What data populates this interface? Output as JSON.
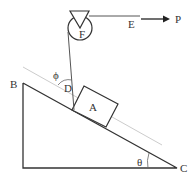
{
  "diagram": {
    "type": "physics-incline-pulley",
    "labels": {
      "pulley": "F",
      "rope_end": "E",
      "force": "P",
      "block": "A",
      "rope_attach": "D",
      "angle_rope": "ϕ",
      "vertex_top": "B",
      "vertex_right": "C",
      "angle_incline": "θ"
    },
    "colors": {
      "line": "#333333",
      "guide_line": "#cccccc",
      "background": "#ffffff"
    }
  }
}
